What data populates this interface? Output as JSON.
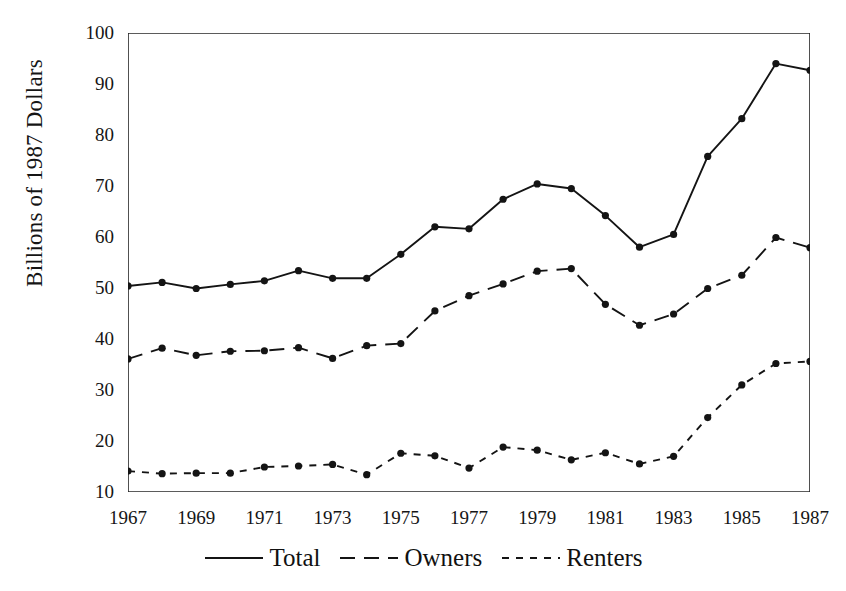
{
  "chart_data": {
    "type": "line",
    "title": "",
    "subtitle": "",
    "xlabel": "",
    "ylabel": "Billions of 1987 Dollars",
    "x": [
      1967,
      1968,
      1969,
      1970,
      1971,
      1972,
      1973,
      1974,
      1975,
      1976,
      1977,
      1978,
      1979,
      1980,
      1981,
      1982,
      1983,
      1984,
      1985,
      1986,
      1987
    ],
    "xlim": [
      1967,
      1987
    ],
    "ylim": [
      10,
      100
    ],
    "ytick_values": [
      10,
      20,
      30,
      40,
      50,
      60,
      70,
      80,
      90,
      100
    ],
    "ytick_labels": [
      "10",
      "20",
      "30",
      "40",
      "50",
      "60",
      "70",
      "80",
      "90",
      "100"
    ],
    "xtick_values": [
      1967,
      1969,
      1971,
      1973,
      1975,
      1977,
      1979,
      1981,
      1983,
      1985,
      1987
    ],
    "xtick_labels": [
      "1967",
      "1969",
      "1971",
      "1973",
      "1975",
      "1977",
      "1979",
      "1981",
      "1983",
      "1985",
      "1987"
    ],
    "xtick_minor_values": [
      1968,
      1970,
      1972,
      1974,
      1976,
      1978,
      1980,
      1982,
      1984,
      1986
    ],
    "grid": false,
    "legend_position": "below",
    "markers": "filled-circle",
    "series": [
      {
        "name": "Total",
        "style": "solid",
        "color": "#141414",
        "values": [
          50.4,
          51.1,
          49.9,
          50.7,
          51.4,
          53.4,
          51.9,
          51.9,
          56.6,
          62.0,
          61.6,
          67.4,
          70.4,
          69.5,
          64.2,
          58.0,
          60.5,
          75.8,
          83.2,
          94.0,
          92.7
        ]
      },
      {
        "name": "Owners",
        "style": "dashed-long",
        "color": "#141414",
        "values": [
          36.1,
          38.2,
          36.8,
          37.6,
          37.7,
          38.3,
          36.2,
          38.7,
          39.1,
          45.5,
          48.5,
          50.8,
          53.3,
          53.8,
          46.8,
          42.7,
          44.9,
          49.9,
          52.5,
          59.9,
          57.9
        ]
      },
      {
        "name": "Renters",
        "style": "dashed-short",
        "color": "#141414",
        "values": [
          14.1,
          13.6,
          13.7,
          13.7,
          14.9,
          15.1,
          15.4,
          13.4,
          17.6,
          17.1,
          14.7,
          18.8,
          18.2,
          16.3,
          17.7,
          15.5,
          17.0,
          24.6,
          31.0,
          35.2,
          35.6
        ]
      }
    ]
  },
  "axis": {
    "top_caption_remnant": " "
  },
  "legend": {
    "items": [
      {
        "label": "Total",
        "style": "solid"
      },
      {
        "label": "Owners",
        "style": "dashed-long"
      },
      {
        "label": "Renters",
        "style": "dashed-short"
      }
    ]
  }
}
